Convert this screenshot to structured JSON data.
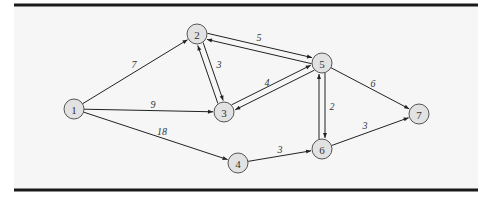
{
  "figure": {
    "panel": {
      "x": 14,
      "y": 5,
      "width": 464,
      "height": 185,
      "background": "#f6f6f6"
    },
    "nodes": [
      {
        "id": "1",
        "label": "1",
        "x": 74,
        "y": 109
      },
      {
        "id": "2",
        "label": "2",
        "x": 197,
        "y": 34
      },
      {
        "id": "3",
        "label": "3",
        "x": 224,
        "y": 112
      },
      {
        "id": "4",
        "label": "4",
        "x": 238,
        "y": 163
      },
      {
        "id": "5",
        "label": "5",
        "x": 322,
        "y": 63
      },
      {
        "id": "6",
        "label": "6",
        "x": 322,
        "y": 149
      },
      {
        "id": "7",
        "label": "7",
        "x": 419,
        "y": 114
      }
    ],
    "edges": [
      {
        "from": "1",
        "to": "2",
        "weight": "7",
        "offset": 0,
        "label_pos": {
          "x": 134,
          "y": 64
        }
      },
      {
        "from": "1",
        "to": "3",
        "weight": "9",
        "offset": 0,
        "label_pos": {
          "x": 153,
          "y": 104
        }
      },
      {
        "from": "1",
        "to": "4",
        "weight": "18",
        "offset": 0,
        "label_pos": {
          "x": 162,
          "y": 131
        }
      },
      {
        "from": "2",
        "to": "5",
        "weight": "5",
        "offset": -3,
        "label_pos": {
          "x": 259,
          "y": 37
        }
      },
      {
        "from": "5",
        "to": "2",
        "weight": "",
        "offset": -3,
        "label_pos": null
      },
      {
        "from": "2",
        "to": "3",
        "weight": "3",
        "offset": -3,
        "label_pos": {
          "x": 219,
          "y": 64
        }
      },
      {
        "from": "3",
        "to": "2",
        "weight": "",
        "offset": -3,
        "label_pos": null
      },
      {
        "from": "3",
        "to": "5",
        "weight": "4",
        "offset": -3,
        "label_pos": {
          "x": 267,
          "y": 82
        }
      },
      {
        "from": "5",
        "to": "3",
        "weight": "",
        "offset": -3,
        "label_pos": null
      },
      {
        "from": "5",
        "to": "6",
        "weight": "2",
        "offset": -3,
        "label_pos": {
          "x": 332,
          "y": 106
        }
      },
      {
        "from": "6",
        "to": "5",
        "weight": "",
        "offset": -3,
        "label_pos": null
      },
      {
        "from": "5",
        "to": "7",
        "weight": "6",
        "offset": 0,
        "label_pos": {
          "x": 373,
          "y": 83
        }
      },
      {
        "from": "4",
        "to": "6",
        "weight": "3",
        "offset": 0,
        "label_pos": {
          "x": 280,
          "y": 149
        }
      },
      {
        "from": "6",
        "to": "7",
        "weight": "3",
        "offset": 0,
        "label_pos": {
          "x": 365,
          "y": 125
        }
      }
    ],
    "node_radius": 10
  }
}
